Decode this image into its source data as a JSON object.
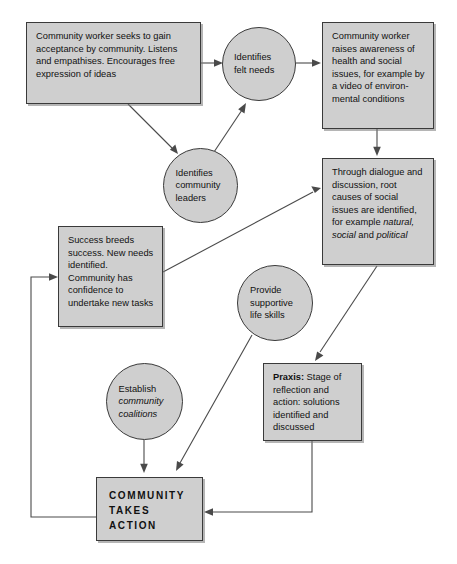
{
  "diagram": {
    "style": {
      "node_fill": "#cfcfcf",
      "node_stroke": "#3a3a3a",
      "arrow_color": "#4a4a4a",
      "background": "#ffffff"
    },
    "nodes": [
      {
        "id": "worker-acceptance",
        "shape": "box",
        "text": "Community worker seeks to gain acceptance by community. Listens and empathises. Encourages free expression of ideas"
      },
      {
        "id": "felt-needs",
        "shape": "circle",
        "text": "Identifies felt needs"
      },
      {
        "id": "raises-awareness",
        "shape": "box",
        "text": "Community worker raises awareness of health and social issues, for example by a video of environ- mental conditions"
      },
      {
        "id": "community-leaders",
        "shape": "circle",
        "text": "Identifies community leaders"
      },
      {
        "id": "through-dialogue",
        "shape": "box",
        "text_plain": "Through dialogue and discussion, root causes of social issues are identified, for example natural, social and political",
        "lead": "Through dialogue and discussion, root causes of social issues are identified, for example ",
        "italic_1": "natural,",
        "mid": " ",
        "italic_2": "social",
        "conj": " and ",
        "italic_3": "political"
      },
      {
        "id": "success-breeds",
        "shape": "box",
        "text": "Success breeds success. New needs identified. Community has confidence to undertake new tasks"
      },
      {
        "id": "life-skills",
        "shape": "circle",
        "text": "Provide supportive life skills"
      },
      {
        "id": "praxis",
        "shape": "box",
        "bold_lead": "Praxis:",
        "rest": " Stage of reflection and action: solutions identified and discussed"
      },
      {
        "id": "coalitions",
        "shape": "circle",
        "lead": "Establish",
        "italic_1": "community",
        "italic_2": "coalitions"
      },
      {
        "id": "community-action",
        "shape": "box",
        "line1": "COMMUNITY",
        "line2": "TAKES",
        "line3": "ACTION"
      }
    ],
    "edges": [
      {
        "from": "worker-acceptance",
        "to": "felt-needs"
      },
      {
        "from": "felt-needs",
        "to": "raises-awareness"
      },
      {
        "from": "worker-acceptance",
        "to": "community-leaders"
      },
      {
        "from": "community-leaders",
        "to": "felt-needs"
      },
      {
        "from": "raises-awareness",
        "to": "through-dialogue"
      },
      {
        "from": "success-breeds",
        "to": "through-dialogue"
      },
      {
        "from": "through-dialogue",
        "to": "praxis"
      },
      {
        "from": "life-skills",
        "to": "community-action"
      },
      {
        "from": "coalitions",
        "to": "community-action"
      },
      {
        "from": "praxis",
        "to": "community-action"
      },
      {
        "from": "community-action",
        "to": "success-breeds"
      }
    ]
  }
}
